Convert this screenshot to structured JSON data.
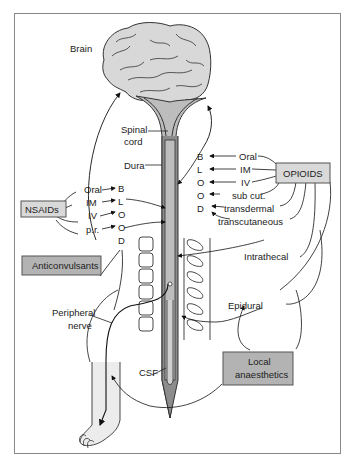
{
  "diagram": {
    "anatomy_labels": {
      "brain": "Brain",
      "spinal_cord_1": "Spinal",
      "spinal_cord_2": "cord",
      "dura": "Dura",
      "csf": "CSF",
      "peripheral_nerve_1": "Peripheral",
      "peripheral_nerve_2": "nerve"
    },
    "drug_boxes": {
      "nsaids": "NSAIDs",
      "anticonvulsants": "Anticonvulsants",
      "opioids": "OPIOIDS",
      "local_anaesthetics_1": "Local",
      "local_anaesthetics_2": "anaesthetics"
    },
    "blood_letters_left": [
      "B",
      "L",
      "O",
      "O",
      "D"
    ],
    "blood_letters_right": [
      "B",
      "L",
      "O",
      "O",
      "D"
    ],
    "nsaid_routes": [
      "Oral",
      "IM",
      "IV",
      "p.r."
    ],
    "opioid_routes": [
      "Oral",
      "IM",
      "IV",
      "sub cut.",
      "transdermal",
      "transcutaneous"
    ],
    "spinal_routes": {
      "intrathecal": "Intrathecal",
      "epidural": "Epidural"
    },
    "colors": {
      "box_fill": "#d9d9d9",
      "dark_box_fill": "#b3b3b3",
      "brain_fill": "#d8d8d8",
      "cord_dark": "#8c8c8c",
      "cord_light": "#bdbdbd",
      "foot_fill": "#ececec"
    }
  }
}
